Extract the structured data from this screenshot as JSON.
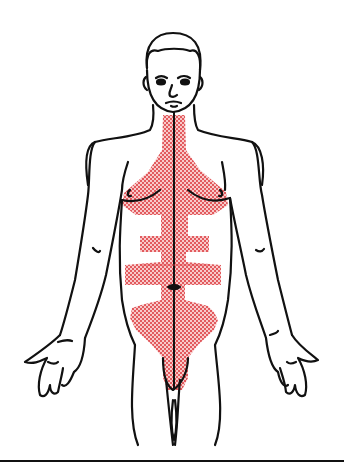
{
  "figure": {
    "subject": "Anterior view of human male body",
    "shaded_region": "neck, sternum, chest, abdomen midline, and groin",
    "colors": {
      "outline": "#111111",
      "shading_dot": "#e0474c",
      "shading_background": "#f6c4c4",
      "background": "#ffffff"
    },
    "midline": "vertical line from chin to groin",
    "bottom_rule": "horizontal line across the bottom of the figure"
  }
}
